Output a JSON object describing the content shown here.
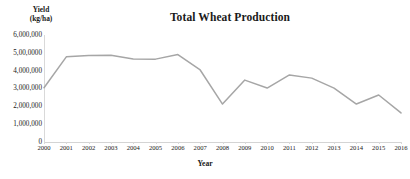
{
  "chart_data": {
    "type": "line",
    "title": "Total Wheat Production",
    "xlabel": "Year",
    "ylabel": "Yield (kg/ha)",
    "ylabel_lines": [
      "Yield",
      "(kg/ha)"
    ],
    "grid": false,
    "legend": "none",
    "ylim": [
      0,
      6000000
    ],
    "ytick_values": [
      0,
      1000000,
      2000000,
      3000000,
      4000000,
      5000000,
      6000000
    ],
    "ytick_labels": [
      "0",
      "1,000,000",
      "2,000,000",
      "3,000,000",
      "4,000,000",
      "5,00,0000",
      "6,000,000"
    ],
    "categories": [
      "2000",
      "2001",
      "2002",
      "2003",
      "2004",
      "2005",
      "2006",
      "2007",
      "2008",
      "2009",
      "2010",
      "2011",
      "2012",
      "2013",
      "2014",
      "2015",
      "2016"
    ],
    "x": [
      2000,
      2001,
      2002,
      2003,
      2004,
      2005,
      2006,
      2007,
      2008,
      2009,
      2010,
      2011,
      2012,
      2013,
      2014,
      2015,
      2016
    ],
    "values": [
      3030000,
      4770000,
      4850000,
      4860000,
      4650000,
      4640000,
      4900000,
      4030000,
      2110000,
      3460000,
      3010000,
      3750000,
      3570000,
      3010000,
      2110000,
      2620000,
      1610000
    ],
    "series": [
      {
        "name": "Total Wheat Production",
        "color": "#a6a6a6",
        "values": [
          3030000,
          4770000,
          4850000,
          4860000,
          4650000,
          4640000,
          4900000,
          4030000,
          2110000,
          3460000,
          3010000,
          3750000,
          3570000,
          3010000,
          2110000,
          2620000,
          1610000
        ]
      }
    ],
    "line_color": "#a6a6a6",
    "axis_color": "#d9d9d9",
    "text_color": "#1a1a1a"
  }
}
